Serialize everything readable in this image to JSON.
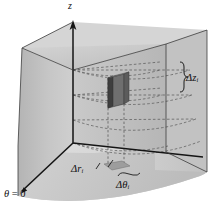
{
  "figure": {
    "axes": {
      "vertical_axis_label": "z",
      "reference_direction_label": "θ = 0"
    },
    "labels": {
      "delta_z": {
        "symbol": "Δz",
        "subscript": "i",
        "full": "Δzᵢ"
      },
      "delta_r": {
        "symbol": "Δr",
        "subscript": "i",
        "full": "Δrᵢ"
      },
      "delta_theta": {
        "symbol": "Δθ",
        "subscript": "i",
        "full": "Δθᵢ"
      },
      "theta_zero": {
        "symbol": "θ",
        "operator": "=",
        "value": "0"
      }
    },
    "colors": {
      "background": "#ffffff",
      "left_face": "#c4c4c4",
      "right_face": "#bdbdbd",
      "top_face": "#d8d8d8",
      "curved_face": "#cfcfcf",
      "floor_face": "#dcdcdc",
      "element_dark": "#4a4a4a",
      "element_mid": "#6d6d6d",
      "element_light": "#8c8c8c",
      "floor_patch": "#9a9a9a",
      "axis_line": "#1a1a1a",
      "dashed_line": "#5a5a5a",
      "label_text": "#111111"
    },
    "geometry": {
      "origin_px": [
        73,
        143
      ],
      "z_axis_top_px": [
        73,
        22
      ],
      "theta0_arrow_tip_px": [
        18,
        196
      ],
      "element_box_px": [
        108,
        78,
        16,
        30
      ]
    }
  }
}
